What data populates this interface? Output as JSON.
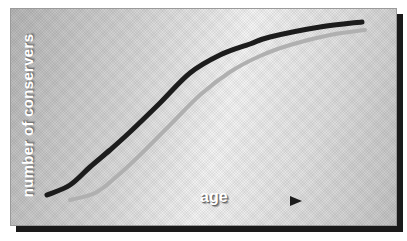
{
  "diagram": {
    "ylabel": "number of conservers",
    "xlabel": "age",
    "curves": [
      {
        "name": "main-curve",
        "color": "#1c1c1c",
        "points": [
          [
            47,
            195
          ],
          [
            70,
            185
          ],
          [
            90,
            167
          ],
          [
            110,
            150
          ],
          [
            130,
            132
          ],
          [
            160,
            103
          ],
          [
            190,
            73
          ],
          [
            220,
            55
          ],
          [
            250,
            44
          ],
          [
            270,
            37
          ],
          [
            320,
            27
          ],
          [
            362,
            22
          ]
        ]
      },
      {
        "name": "shadow-curve",
        "color": "#b0b0b0",
        "points": [
          [
            70,
            200
          ],
          [
            95,
            193
          ],
          [
            115,
            178
          ],
          [
            140,
            155
          ],
          [
            170,
            125
          ],
          [
            200,
            95
          ],
          [
            230,
            72
          ],
          [
            260,
            56
          ],
          [
            290,
            45
          ],
          [
            330,
            35
          ],
          [
            365,
            30
          ]
        ]
      }
    ],
    "arrow": {
      "from": [
        230,
        201
      ],
      "to": [
        300,
        201
      ],
      "color": "#1c1c1c"
    }
  }
}
